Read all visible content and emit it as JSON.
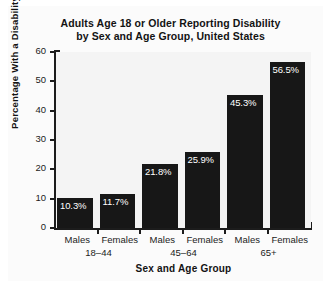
{
  "chart_data": {
    "type": "bar",
    "title": "Adults Age 18 or Older Reporting Disability by Sex and Age Group, United States",
    "title_line1": "Adults Age 18 or Older Reporting Disability",
    "title_line2": "by Sex and Age Group, United States",
    "xlabel": "Sex and Age Group",
    "ylabel": "Percentage With a Disability",
    "categories": [
      "Males",
      "Females",
      "Males",
      "Females",
      "Males",
      "Females"
    ],
    "groups": [
      {
        "label": "18–44",
        "categories": [
          "Males",
          "Females"
        ],
        "values": [
          10.3,
          11.7
        ]
      },
      {
        "label": "45–64",
        "categories": [
          "Males",
          "Females"
        ],
        "values": [
          21.8,
          25.9
        ]
      },
      {
        "label": "65+",
        "categories": [
          "Males",
          "Females"
        ],
        "values": [
          45.3,
          56.5
        ]
      }
    ],
    "values": [
      10.3,
      11.7,
      21.8,
      25.9,
      45.3,
      56.5
    ],
    "data_labels": [
      "10.3%",
      "11.7%",
      "21.8%",
      "25.9%",
      "45.3%",
      "56.5%"
    ],
    "ylim": [
      0,
      60
    ],
    "yticks": [
      0,
      10,
      20,
      30,
      40,
      50,
      60
    ],
    "ytick_labels": [
      "0",
      "10",
      "20",
      "30",
      "40",
      "50",
      "60"
    ],
    "grid": false,
    "legend": "none",
    "bar_color": "#171717",
    "data_label_color": "#ffffff",
    "axis_color": "#1c1c1c",
    "background_color": "#fbfbfb"
  }
}
